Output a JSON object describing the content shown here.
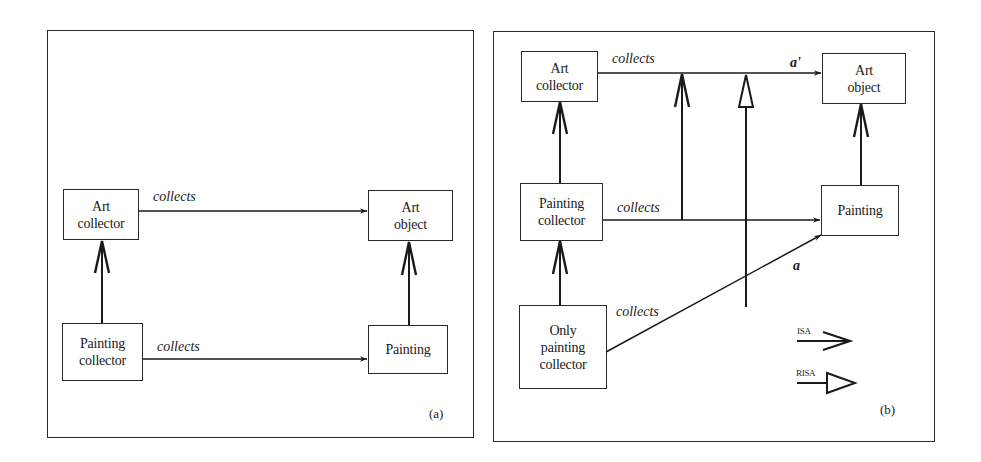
{
  "figure": {
    "panels": [
      {
        "id": "a",
        "caption": "(a)",
        "nodes": {
          "art_collector": {
            "lines": [
              "Art",
              "collector"
            ]
          },
          "art_object": {
            "lines": [
              "Art",
              "object"
            ]
          },
          "painting_collector": {
            "lines": [
              "Painting",
              "collector"
            ]
          },
          "painting": {
            "lines": [
              "Painting"
            ]
          }
        },
        "edges": {
          "top_collects": {
            "label": "collects",
            "from": "Art collector",
            "to": "Art object",
            "type": "relation"
          },
          "bottom_collects": {
            "label": "collects",
            "from": "Painting collector",
            "to": "Painting",
            "type": "relation"
          },
          "isa_left": {
            "from": "Painting collector",
            "to": "Art collector",
            "type": "ISA"
          },
          "isa_right": {
            "from": "Painting",
            "to": "Art object",
            "type": "ISA"
          }
        }
      },
      {
        "id": "b",
        "caption": "(b)",
        "nodes": {
          "art_collector": {
            "lines": [
              "Art",
              "collector"
            ]
          },
          "art_object": {
            "lines": [
              "Art",
              "object"
            ]
          },
          "painting_collector": {
            "lines": [
              "Painting",
              "collector"
            ]
          },
          "painting": {
            "lines": [
              "Painting"
            ]
          },
          "only_painting_collector": {
            "lines": [
              "Only",
              "painting",
              "collector"
            ]
          }
        },
        "edges": {
          "top_collects": {
            "label": "collects",
            "tag": "a'",
            "from": "Art collector",
            "to": "Art object",
            "type": "relation"
          },
          "middle_collects": {
            "label": "collects",
            "from": "Painting collector",
            "to": "Painting",
            "type": "relation"
          },
          "bottom_collects": {
            "label": "collects",
            "tag": "a",
            "from": "Only painting collector",
            "to": "Painting",
            "type": "relation"
          },
          "isa_pc_ac": {
            "from": "Painting collector",
            "to": "Art collector",
            "type": "ISA"
          },
          "isa_opc_pc": {
            "from": "Only painting collector",
            "to": "Painting collector",
            "type": "ISA"
          },
          "isa_p_ao": {
            "from": "Painting",
            "to": "Art object",
            "type": "ISA"
          },
          "isa_rel": {
            "from": "middle collects",
            "to": "top collects (a')",
            "type": "ISA"
          },
          "risa_rel": {
            "from": "bottom collects (a)",
            "to": "top collects (a')",
            "type": "RISA"
          }
        },
        "legend": [
          {
            "label": "ISA",
            "arrow": "open-chevron-arrow"
          },
          {
            "label": "RISA",
            "arrow": "hollow-triangle-arrow"
          }
        ]
      }
    ]
  }
}
